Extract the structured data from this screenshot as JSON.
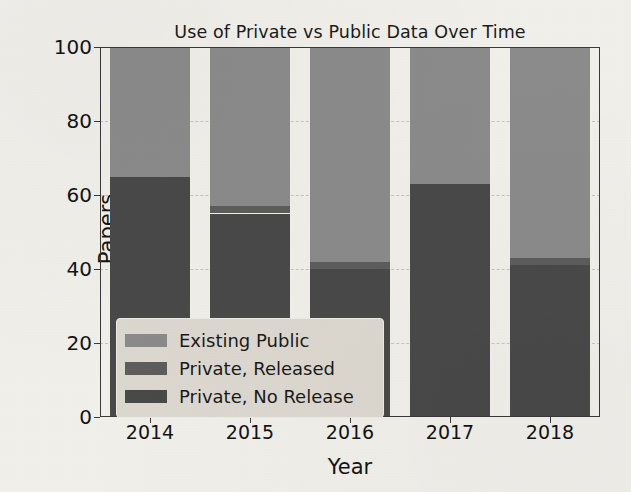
{
  "chart_data": {
    "type": "bar",
    "subtype": "stacked-bar",
    "title": "Use of Private vs Public Data Over Time",
    "xlabel": "Year",
    "ylabel": "Papers",
    "categories": [
      "2014",
      "2015",
      "2016",
      "2017",
      "2018"
    ],
    "series": [
      {
        "name": "Private, No Release",
        "values": [
          65,
          55,
          40,
          63,
          41
        ],
        "color": "#4a4a4a"
      },
      {
        "name": "Private, Released",
        "values": [
          0,
          2,
          2,
          0,
          2
        ],
        "color": "#5e5e5e"
      },
      {
        "name": "Existing Public",
        "values": [
          35,
          43,
          58,
          37,
          57
        ],
        "color": "#8c8c8c"
      }
    ],
    "stack_order_bottom_to_top": [
      "Private, No Release",
      "Private, Released",
      "Existing Public"
    ],
    "ylim": [
      0,
      100
    ],
    "yticks": [
      "0",
      "20",
      "40",
      "60",
      "80",
      "100"
    ],
    "ytick_values": [
      0,
      20,
      40,
      60,
      80,
      100
    ],
    "xticks": [
      "2014",
      "2015",
      "2016",
      "2017",
      "2018"
    ],
    "grid": true,
    "grid_axis": "y",
    "legend_position": "lower left",
    "legend_entries": [
      "Existing Public",
      "Private, Released",
      "Private, No Release"
    ],
    "background_color": "#f3f1ec",
    "axis_color": "#3a3a3a"
  }
}
